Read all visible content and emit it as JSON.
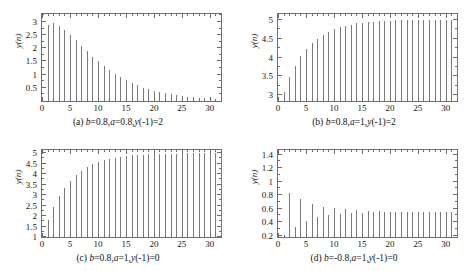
{
  "figure": {
    "type": "figure-grid",
    "rows": 2,
    "cols": 2,
    "background": "#ffffff",
    "stem_color": "#7a7a7a",
    "axis_color": "#6d6d6d"
  },
  "chart_data": [
    {
      "id": "panel-a",
      "type": "scatter",
      "plot_style": "stem",
      "title": "",
      "caption": "(a) b=0.8,a=0.8,y(-1)=2",
      "caption_parts": {
        "index": "(a) ",
        "b_sym": "b",
        "b_val": "=0.8,",
        "a_sym": "a",
        "a_val": "=0.8,",
        "y_sym": "y",
        "y_val": "(-1)=2"
      },
      "xlabel": "",
      "ylabel": "y(n)",
      "xlim": [
        0,
        32
      ],
      "ylim": [
        0,
        3.3
      ],
      "grid": false,
      "legend": "none",
      "xticks": [
        0,
        5,
        10,
        15,
        20,
        25,
        30
      ],
      "xticklabels": [
        "0",
        "5",
        "10",
        "15",
        "20",
        "25",
        "30"
      ],
      "yticks": [
        0.5,
        1,
        1.5,
        2,
        2.5,
        3
      ],
      "yticklabels": [
        "0.5",
        "1",
        "1.5",
        "2",
        "2.5",
        "3"
      ],
      "x": [
        1,
        2,
        3,
        4,
        5,
        6,
        7,
        8,
        9,
        10,
        11,
        12,
        13,
        14,
        15,
        16,
        17,
        18,
        19,
        20,
        21,
        22,
        23,
        24,
        25,
        26,
        27,
        28,
        29,
        30,
        31,
        32
      ],
      "values": [
        2.88,
        2.95,
        2.86,
        2.7,
        2.5,
        2.3,
        2.08,
        1.88,
        1.68,
        1.5,
        1.33,
        1.17,
        1.02,
        0.9,
        0.78,
        0.68,
        0.59,
        0.51,
        0.44,
        0.38,
        0.33,
        0.29,
        0.25,
        0.22,
        0.19,
        0.17,
        0.15,
        0.13,
        0.11,
        0.1,
        0.09,
        0.08
      ]
    },
    {
      "id": "panel-b",
      "type": "scatter",
      "plot_style": "stem",
      "title": "",
      "caption": "(b) b=0.8,a=1,y(-1)=2",
      "caption_parts": {
        "index": "(b) ",
        "b_sym": "b",
        "b_val": "=0.8,",
        "a_sym": "a",
        "a_val": "=1,",
        "y_sym": "y",
        "y_val": "(-1)=2"
      },
      "xlabel": "",
      "ylabel": "y(n)",
      "xlim": [
        0,
        32
      ],
      "ylim": [
        2.85,
        5.15
      ],
      "grid": false,
      "legend": "none",
      "xticks": [
        0,
        5,
        10,
        15,
        20,
        25,
        30
      ],
      "xticklabels": [
        "0",
        "5",
        "10",
        "15",
        "20",
        "25",
        "30"
      ],
      "yticks": [
        3,
        3.5,
        4,
        4.5,
        5
      ],
      "yticklabels": [
        "3",
        "3.5",
        "4",
        "4.5",
        "5"
      ],
      "x": [
        1,
        2,
        3,
        4,
        5,
        6,
        7,
        8,
        9,
        10,
        11,
        12,
        13,
        14,
        15,
        16,
        17,
        18,
        19,
        20,
        21,
        22,
        23,
        24,
        25,
        26,
        27,
        28,
        29,
        30,
        31,
        32
      ],
      "values": [
        3.1,
        3.48,
        3.78,
        4.03,
        4.22,
        4.38,
        4.5,
        4.6,
        4.68,
        4.75,
        4.8,
        4.84,
        4.87,
        4.9,
        4.92,
        4.93,
        4.95,
        4.96,
        4.97,
        4.97,
        4.98,
        4.98,
        4.98,
        4.99,
        4.99,
        4.99,
        4.99,
        4.99,
        5.0,
        5.0,
        5.0,
        5.0
      ]
    },
    {
      "id": "panel-c",
      "type": "scatter",
      "plot_style": "stem",
      "title": "",
      "caption": "(c) b=0.8,a=1,y(-1)=0",
      "caption_parts": {
        "index": "(c) ",
        "b_sym": "b",
        "b_val": "=0.8,",
        "a_sym": "a",
        "a_val": "=1,",
        "y_sym": "y",
        "y_val": "(-1)=0"
      },
      "xlabel": "",
      "ylabel": "y(n)",
      "xlim": [
        0,
        32
      ],
      "ylim": [
        1,
        5.15
      ],
      "grid": false,
      "legend": "none",
      "xticks": [
        0,
        5,
        10,
        15,
        20,
        25,
        30
      ],
      "xticklabels": [
        "0",
        "5",
        "10",
        "15",
        "20",
        "25",
        "30"
      ],
      "yticks": [
        1,
        1.5,
        2,
        2.5,
        3,
        3.5,
        4,
        4.5,
        5
      ],
      "yticklabels": [
        "1",
        "1.5",
        "2",
        "2.5",
        "3",
        "3.5",
        "4",
        "4.5",
        "5"
      ],
      "x": [
        1,
        2,
        3,
        4,
        5,
        6,
        7,
        8,
        9,
        10,
        11,
        12,
        13,
        14,
        15,
        16,
        17,
        18,
        19,
        20,
        21,
        22,
        23,
        24,
        25,
        26,
        27,
        28,
        29,
        30,
        31,
        32
      ],
      "values": [
        1.8,
        2.44,
        2.95,
        3.36,
        3.69,
        3.95,
        4.16,
        4.33,
        4.46,
        4.57,
        4.66,
        4.73,
        4.78,
        4.82,
        4.86,
        4.89,
        4.91,
        4.93,
        4.94,
        4.95,
        4.96,
        4.97,
        4.98,
        4.98,
        4.98,
        4.99,
        4.99,
        4.99,
        4.99,
        5.0,
        5.0,
        5.0
      ]
    },
    {
      "id": "panel-d",
      "type": "scatter",
      "plot_style": "stem",
      "title": "",
      "caption": "(d) b=-0.8,a=1,y(-1)=0",
      "caption_parts": {
        "index": "(d) ",
        "b_sym": "b",
        "b_val": "=-0.8,",
        "a_sym": "a",
        "a_val": "=1,",
        "y_sym": "y",
        "y_val": "(-1)=0"
      },
      "xlabel": "",
      "ylabel": "y(n)",
      "xlim": [
        0,
        32
      ],
      "ylim": [
        0.18,
        1.47
      ],
      "grid": false,
      "legend": "none",
      "xticks": [
        0,
        5,
        10,
        15,
        20,
        25,
        30
      ],
      "xticklabels": [
        "0",
        "5",
        "10",
        "15",
        "20",
        "25",
        "30"
      ],
      "yticks": [
        0.2,
        0.4,
        0.6,
        0.8,
        1,
        1.2,
        1.4
      ],
      "yticklabels": [
        "0.2",
        "0.4",
        "0.6",
        "0.8",
        "1",
        "1.2",
        "1.4"
      ],
      "x": [
        2,
        3,
        4,
        5,
        6,
        7,
        8,
        9,
        10,
        11,
        12,
        13,
        14,
        15,
        16,
        17,
        18,
        19,
        20,
        21,
        22,
        23,
        24,
        25,
        26,
        27,
        28,
        29,
        30,
        31,
        32
      ],
      "values": [
        0.84,
        0.33,
        0.74,
        0.42,
        0.67,
        0.47,
        0.63,
        0.5,
        0.61,
        0.52,
        0.59,
        0.53,
        0.58,
        0.54,
        0.57,
        0.545,
        0.565,
        0.548,
        0.558,
        0.551,
        0.557,
        0.552,
        0.556,
        0.553,
        0.556,
        0.554,
        0.556,
        0.554,
        0.556,
        0.554,
        0.556
      ]
    }
  ]
}
